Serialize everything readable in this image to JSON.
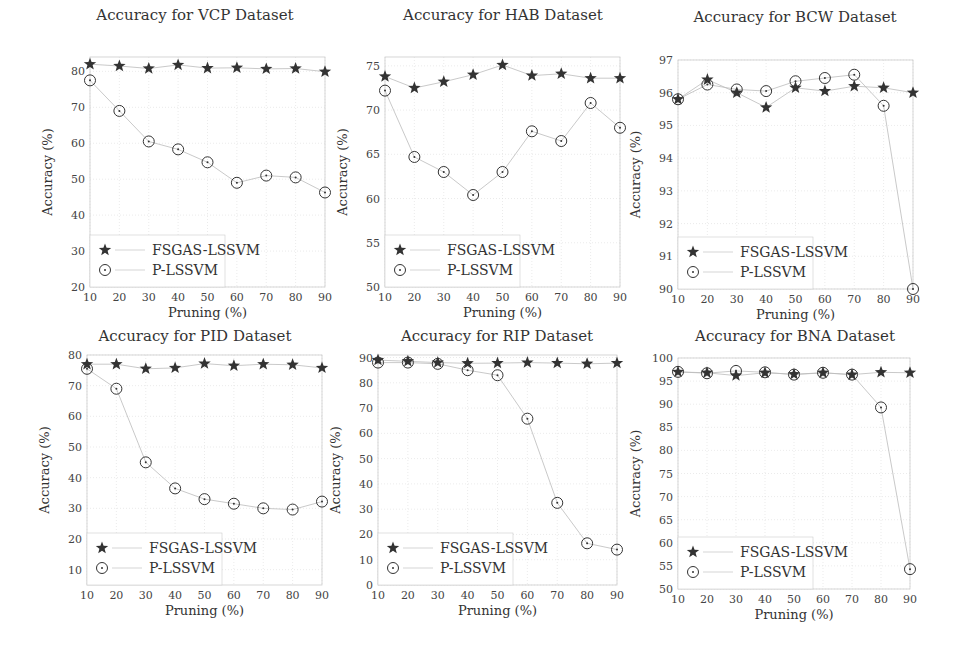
{
  "chart_data": [
    {
      "type": "line",
      "title": "Accuracy for VCP Dataset",
      "xlabel": "Pruning (%)",
      "ylabel": "Accuracy (%)",
      "x": [
        10,
        20,
        30,
        40,
        50,
        60,
        70,
        80,
        90
      ],
      "xlim": [
        10,
        90
      ],
      "ylim": [
        20,
        84
      ],
      "yticks": [
        20,
        30,
        40,
        50,
        60,
        70,
        80
      ],
      "series": [
        {
          "name": "FSGAS-LSSVM",
          "marker": "star",
          "values": [
            82,
            81.5,
            80.8,
            81.8,
            80.9,
            81,
            80.7,
            80.8,
            79.9
          ]
        },
        {
          "name": "P-LSSVM",
          "marker": "circled-dot",
          "values": [
            77.5,
            69,
            60.5,
            58.3,
            54.7,
            49,
            51,
            50.5,
            46.3
          ]
        }
      ],
      "legend_position": "lower left",
      "grid": true
    },
    {
      "type": "line",
      "title": "Accuracy for HAB Dataset",
      "xlabel": "Pruning (%)",
      "ylabel": "Accuracy (%)",
      "x": [
        10,
        20,
        30,
        40,
        50,
        60,
        70,
        80,
        90
      ],
      "xlim": [
        10,
        90
      ],
      "ylim": [
        50,
        76
      ],
      "yticks": [
        50,
        55,
        60,
        65,
        70,
        75
      ],
      "series": [
        {
          "name": "FSGAS-LSSVM",
          "marker": "star",
          "values": [
            73.8,
            72.5,
            73.2,
            74,
            75.1,
            73.9,
            74.1,
            73.6,
            73.6
          ]
        },
        {
          "name": "P-LSSVM",
          "marker": "circled-dot",
          "values": [
            72.2,
            64.7,
            63,
            60.4,
            63,
            67.6,
            66.5,
            70.8,
            68
          ]
        }
      ],
      "legend_position": "lower left",
      "grid": true
    },
    {
      "type": "line",
      "title": "Accuracy for BCW Dataset",
      "xlabel": "Pruning (%)",
      "ylabel": "Accuracy (%)",
      "x": [
        10,
        20,
        30,
        40,
        50,
        60,
        70,
        80,
        90
      ],
      "xlim": [
        10,
        90
      ],
      "ylim": [
        90,
        97
      ],
      "yticks": [
        90,
        91,
        92,
        93,
        94,
        95,
        96,
        97
      ],
      "series": [
        {
          "name": "FSGAS-LSSVM",
          "marker": "star",
          "values": [
            95.8,
            96.4,
            96,
            95.55,
            96.15,
            96.05,
            96.2,
            96.15,
            96
          ]
        },
        {
          "name": "P-LSSVM",
          "marker": "circled-dot",
          "values": [
            95.8,
            96.25,
            96.1,
            96.05,
            96.35,
            96.45,
            96.55,
            95.6,
            90
          ]
        }
      ],
      "legend_position": "lower left",
      "grid": true
    },
    {
      "type": "line",
      "title": "Accuracy for PID Dataset",
      "xlabel": "Pruning (%)",
      "ylabel": "Accuracy (%)",
      "x": [
        10,
        20,
        30,
        40,
        50,
        60,
        70,
        80,
        90
      ],
      "xlim": [
        10,
        90
      ],
      "ylim": [
        5,
        80
      ],
      "yticks": [
        10,
        20,
        30,
        40,
        50,
        60,
        70,
        80
      ],
      "series": [
        {
          "name": "FSGAS-LSSVM",
          "marker": "star",
          "values": [
            77,
            77,
            75.5,
            75.8,
            77.2,
            76.5,
            77,
            76.8,
            75.8
          ]
        },
        {
          "name": "P-LSSVM",
          "marker": "circled-dot",
          "values": [
            75.5,
            69,
            45,
            36.5,
            33,
            31.5,
            30,
            29.6,
            32.2
          ]
        }
      ],
      "legend_position": "lower left",
      "grid": true
    },
    {
      "type": "line",
      "title": "Accuracy for RIP Dataset",
      "xlabel": "Pruning (%)",
      "ylabel": "Accuracy (%)",
      "x": [
        10,
        20,
        30,
        40,
        50,
        60,
        70,
        80,
        90
      ],
      "xlim": [
        10,
        90
      ],
      "ylim": [
        0,
        91
      ],
      "yticks": [
        0,
        10,
        20,
        30,
        40,
        50,
        60,
        70,
        80,
        90
      ],
      "series": [
        {
          "name": "FSGAS-LSSVM",
          "marker": "star",
          "values": [
            89,
            88.5,
            88,
            87.7,
            87.8,
            88,
            87.8,
            87.5,
            87.8
          ]
        },
        {
          "name": "P-LSSVM",
          "marker": "circled-dot",
          "values": [
            88,
            88,
            87.5,
            85,
            83,
            65.8,
            32.5,
            16.5,
            14
          ]
        }
      ],
      "legend_position": "lower left",
      "grid": true
    },
    {
      "type": "line",
      "title": "Accuracy for BNA Dataset",
      "xlabel": "Pruning (%)",
      "ylabel": "Accuracy (%)",
      "x": [
        10,
        20,
        30,
        40,
        50,
        60,
        70,
        80,
        90
      ],
      "xlim": [
        10,
        90
      ],
      "ylim": [
        50,
        100
      ],
      "yticks": [
        50,
        55,
        60,
        65,
        70,
        75,
        80,
        85,
        90,
        95,
        100
      ],
      "series": [
        {
          "name": "FSGAS-LSSVM",
          "marker": "star",
          "values": [
            97,
            96.8,
            96.2,
            96.8,
            96.5,
            96.8,
            96.4,
            96.9,
            96.8
          ]
        },
        {
          "name": "P-LSSVM",
          "marker": "circled-dot",
          "values": [
            97,
            96.7,
            97.2,
            96.9,
            96.4,
            96.8,
            96.4,
            89.3,
            54.3
          ]
        }
      ],
      "legend_position": "lower left",
      "grid": true
    }
  ],
  "panels": [
    {
      "title": "Accuracy for VCP Dataset",
      "xlabel": "Pruning (%)",
      "ylabel": "Accuracy (%)",
      "legend": [
        "FSGAS-LSSVM",
        "P-LSSVM"
      ]
    },
    {
      "title": "Accuracy for HAB Dataset",
      "xlabel": "Pruning (%)",
      "ylabel": "Accuracy (%)",
      "legend": [
        "FSGAS-LSSVM",
        "P-LSSVM"
      ]
    },
    {
      "title": "Accuracy for BCW Dataset",
      "xlabel": "Pruning (%)",
      "ylabel": "Accuracy (%)",
      "legend": [
        "FSGAS-LSSVM",
        "P-LSSVM"
      ]
    },
    {
      "title": "Accuracy for PID Dataset",
      "xlabel": "Pruning (%)",
      "ylabel": "Accuracy (%)",
      "legend": [
        "FSGAS-LSSVM",
        "P-LSSVM"
      ]
    },
    {
      "title": "Accuracy for RIP Dataset",
      "xlabel": "Pruning (%)",
      "ylabel": "Accuracy (%)",
      "legend": [
        "FSGAS-LSSVM",
        "P-LSSVM"
      ]
    },
    {
      "title": "Accuracy for BNA Dataset",
      "xlabel": "Pruning (%)",
      "ylabel": "Accuracy (%)",
      "legend": [
        "FSGAS-LSSVM",
        "P-LSSVM"
      ]
    }
  ],
  "colors": {
    "marker": "#333333",
    "line": "#bbbbbb",
    "grid": "#dddddd",
    "frame": "#cccccc"
  }
}
